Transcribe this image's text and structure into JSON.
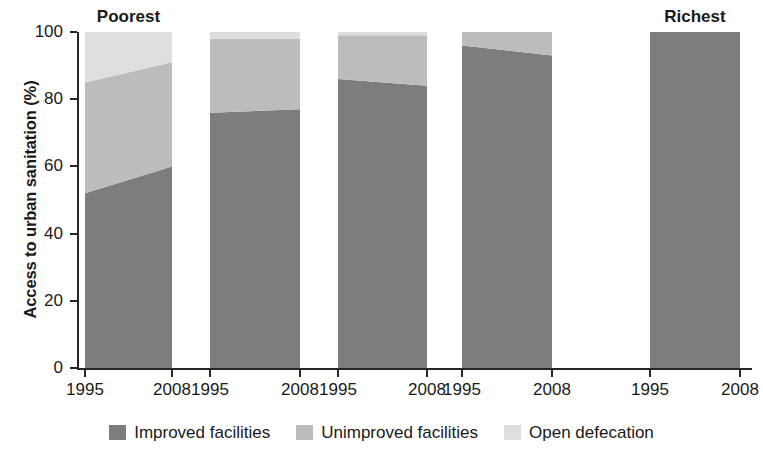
{
  "chart_data": {
    "type": "area",
    "title": "",
    "xlabel": "",
    "ylabel": "Access to urban sanitation (%)",
    "ylim": [
      0,
      100
    ],
    "yticks": [
      0,
      20,
      40,
      60,
      80,
      100
    ],
    "grid": false,
    "legend_position": "bottom",
    "stacked": true,
    "x": [
      "1995",
      "2008"
    ],
    "groups": [
      {
        "name": "Poorest",
        "label_shown": true,
        "x_labels": [
          "1995",
          "2008"
        ],
        "series": {
          "Improved facilities": [
            52,
            60
          ],
          "Unimproved facilities": [
            33,
            31
          ],
          "Open defecation": [
            15,
            9
          ]
        }
      },
      {
        "name": "Quintile 2",
        "label_shown": false,
        "x_labels": [
          "1995",
          "2008"
        ],
        "series": {
          "Improved facilities": [
            76,
            77
          ],
          "Unimproved facilities": [
            22,
            21
          ],
          "Open defecation": [
            2,
            2
          ]
        }
      },
      {
        "name": "Quintile 3",
        "label_shown": false,
        "x_labels": [
          "1995",
          "2008"
        ],
        "series": {
          "Improved facilities": [
            86,
            84
          ],
          "Unimproved facilities": [
            13,
            15
          ],
          "Open defecation": [
            1,
            1
          ]
        }
      },
      {
        "name": "Quintile 4",
        "label_shown": false,
        "x_labels": [
          "1995",
          "2008"
        ],
        "series": {
          "Improved facilities": [
            96,
            93
          ],
          "Unimproved facilities": [
            4,
            7
          ],
          "Open defecation": [
            0,
            0
          ]
        }
      },
      {
        "name": "Richest",
        "label_shown": true,
        "x_labels": [
          "1995",
          "2008"
        ],
        "series": {
          "Improved facilities": [
            100,
            100
          ],
          "Unimproved facilities": [
            0,
            0
          ],
          "Open defecation": [
            0,
            0
          ]
        }
      }
    ],
    "legend": [
      {
        "name": "Improved facilities",
        "color": "#7d7d7d"
      },
      {
        "name": "Unimproved facilities",
        "color": "#bcbcbc"
      },
      {
        "name": "Open defecation",
        "color": "#dedede"
      }
    ]
  },
  "axis": {
    "y_title": "Access to urban sanitation (%)",
    "y_tick_labels": [
      "100",
      "80",
      "60",
      "40",
      "20",
      "0"
    ],
    "x_tick_labels": [
      "1995",
      "2008",
      "1995",
      "2008",
      "1995",
      "2008",
      "1995",
      "2008",
      "1995",
      "2008"
    ]
  },
  "group_headers": {
    "left": "Poorest",
    "right": "Richest"
  },
  "legend": {
    "items": [
      {
        "label": "Improved facilities",
        "color": "#7d7d7d"
      },
      {
        "label": "Unimproved facilities",
        "color": "#bcbcbc"
      },
      {
        "label": "Open defecation",
        "color": "#dedede"
      }
    ]
  }
}
